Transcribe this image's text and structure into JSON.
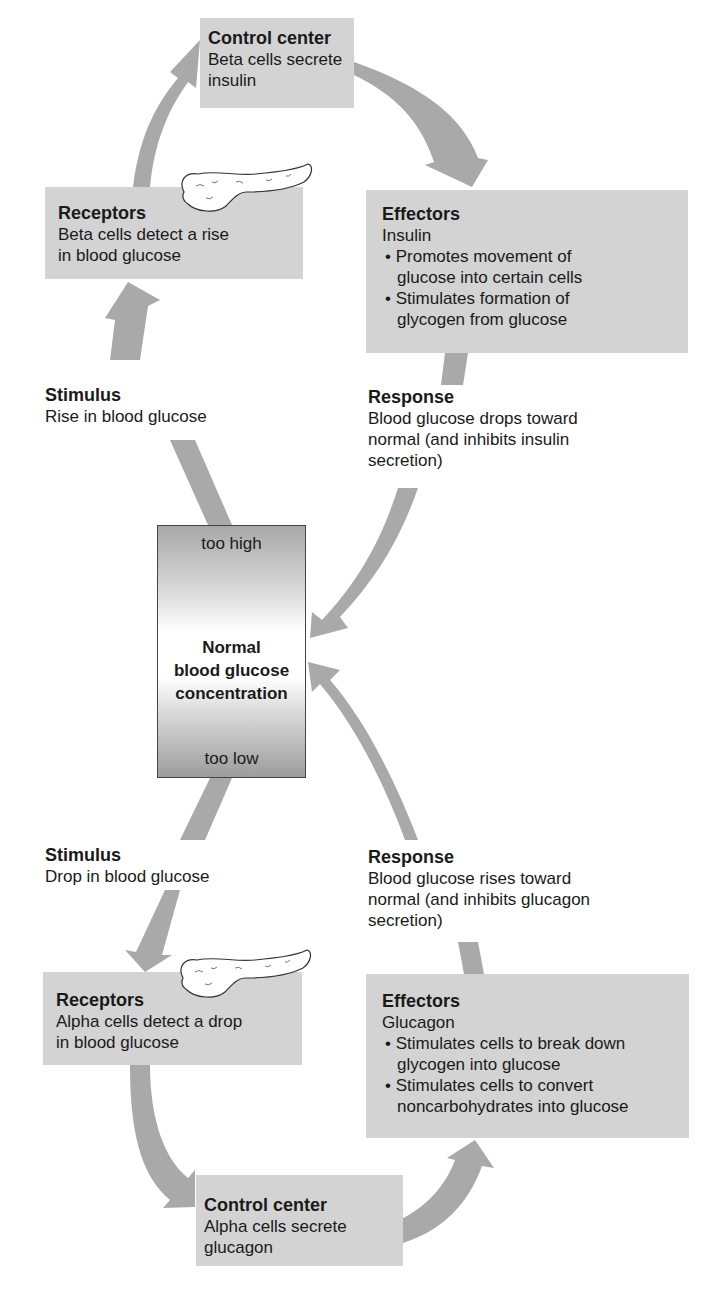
{
  "diagram": {
    "top_loop": {
      "control_center": {
        "title": "Control center",
        "text": [
          "Beta cells secrete",
          "insulin"
        ]
      },
      "receptors": {
        "title": "Receptors",
        "text": [
          "Beta cells detect a rise",
          "in blood glucose"
        ]
      },
      "effectors": {
        "title": "Effectors",
        "subtitle": "Insulin",
        "bullets": [
          "• Promotes movement of glucose into certain cells",
          "• Stimulates formation of glycogen from glucose"
        ]
      },
      "stimulus": {
        "title": "Stimulus",
        "text": "Rise in blood glucose"
      },
      "response": {
        "title": "Response",
        "text": [
          "Blood glucose drops toward",
          "normal (and inhibits insulin",
          "secretion)"
        ]
      }
    },
    "center": {
      "too_high": "too high",
      "label": [
        "Normal",
        "blood glucose",
        "concentration"
      ],
      "too_low": "too low"
    },
    "bottom_loop": {
      "stimulus": {
        "title": "Stimulus",
        "text": "Drop in blood glucose"
      },
      "response": {
        "title": "Response",
        "text": [
          "Blood glucose rises toward",
          "normal (and inhibits glucagon",
          "secretion)"
        ]
      },
      "receptors": {
        "title": "Receptors",
        "text": [
          "Alpha cells detect a drop",
          "in blood glucose"
        ]
      },
      "effectors": {
        "title": "Effectors",
        "subtitle": "Glucagon",
        "bullets": [
          "• Stimulates cells to break down glycogen into glucose",
          "• Stimulates cells to convert noncarbohydrates into glucose"
        ]
      },
      "control_center": {
        "title": "Control center",
        "text": [
          "Alpha cells secrete",
          "glucagon"
        ]
      }
    },
    "colors": {
      "box": "#d3d3d3",
      "arrow": "#a9a9a9",
      "text": "#1a1a1a"
    },
    "icons": [
      "pancreas-icon",
      "pancreas-icon"
    ]
  }
}
